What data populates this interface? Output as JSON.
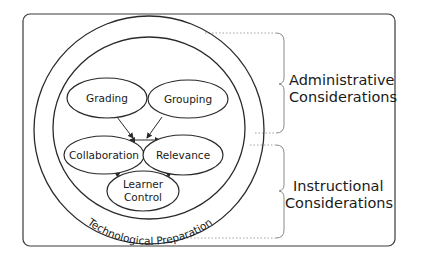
{
  "diagram": {
    "type": "conceptual-diagram",
    "colors": {
      "stroke": "#2a2a2a",
      "dotted": "#9a9a9a",
      "background": "#ffffff",
      "text": "#1a1a1a"
    },
    "outer_ring_label": "Technological Preparation",
    "nodes": [
      {
        "id": "grading",
        "label": "Grading"
      },
      {
        "id": "grouping",
        "label": "Grouping"
      },
      {
        "id": "collaboration",
        "label": "Collaboration"
      },
      {
        "id": "relevance",
        "label": "Relevance"
      },
      {
        "id": "learner_control",
        "label_line1": "Learner",
        "label_line2": "Control"
      }
    ],
    "edges": [
      {
        "from": "grading",
        "to": "collaboration_relevance_junction",
        "style": "arrow"
      },
      {
        "from": "grouping",
        "to": "collaboration_relevance_junction",
        "style": "arrow"
      },
      {
        "from": "collaboration",
        "to": "relevance",
        "style": "double-arrow"
      },
      {
        "from": "collaboration",
        "to": "learner_control",
        "style": "double-arrow"
      },
      {
        "from": "relevance",
        "to": "learner_control",
        "style": "double-arrow"
      }
    ],
    "groups": [
      {
        "id": "administrative",
        "line1": "Administrative",
        "line2": "Considerations"
      },
      {
        "id": "instructional",
        "line1": "Instructional",
        "line2": "Considerations"
      }
    ]
  }
}
